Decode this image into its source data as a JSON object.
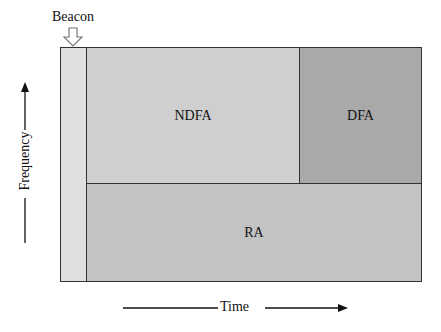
{
  "diagram": {
    "beacon_label": "Beacon",
    "axis_y_label": "Frequency",
    "axis_x_label": "Time",
    "regions": [
      {
        "id": "beacon",
        "label": "",
        "color": "#e0e0e0"
      },
      {
        "id": "ndfa",
        "label": "NDFA",
        "color": "#cfcfcf"
      },
      {
        "id": "dfa",
        "label": "DFA",
        "color": "#a9a9a9"
      },
      {
        "id": "ra",
        "label": "RA",
        "color": "#c3c3c3"
      }
    ]
  }
}
